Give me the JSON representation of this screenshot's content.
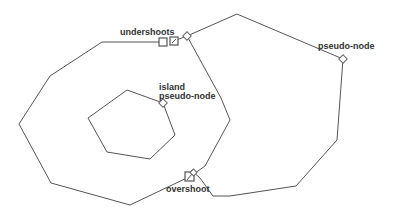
{
  "diagram": {
    "type": "polygon-topology-errors",
    "labels": {
      "undershoots": "undershoots",
      "pseudo_node": "pseudo-node",
      "island_line1": "island",
      "island_line2": "pseudo-node",
      "overshoot": "overshoot"
    },
    "colors": {
      "line": "#555555",
      "text": "#333333",
      "background": "#ffffff"
    },
    "shapes": {
      "left_polygon": "left large polygon (closed, with undershoot gap near top and overshoot at lower right)",
      "right_polygon": "right large polygon",
      "island": "hexagon island inside left polygon"
    },
    "markers": [
      "undershoot-square-1",
      "undershoot-square-2",
      "pseudo-node-diamond-top",
      "pseudo-node-diamond-right",
      "island-pseudo-node-diamond",
      "overshoot-square"
    ]
  }
}
